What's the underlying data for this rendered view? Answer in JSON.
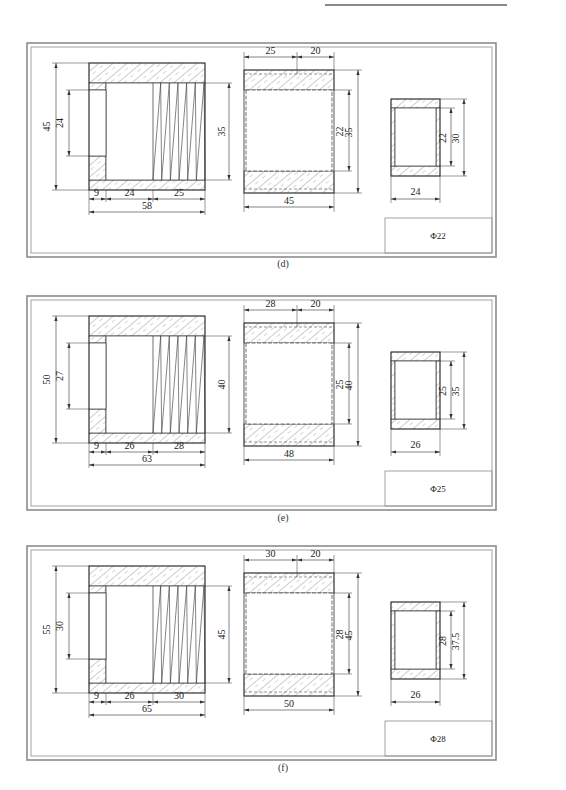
{
  "header": {
    "rule": "top-right running header rule"
  },
  "panels": [
    {
      "id": "d",
      "caption": "(d)",
      "title_block": "Φ22",
      "threaded_sleeve": {
        "outer_dia": "45",
        "bore_dia": "24",
        "thread_dia": "35",
        "len_a": "9",
        "len_b": "24",
        "len_c": "25",
        "total_len": "58"
      },
      "tube": {
        "len_left": "25",
        "len_right": "20",
        "inner_dia": "22",
        "outer_dia": "35",
        "total_len": "45"
      },
      "small_tube": {
        "inner_dia": "22",
        "outer_dia": "30",
        "length": "24"
      }
    },
    {
      "id": "e",
      "caption": "(e)",
      "title_block": "Φ25",
      "threaded_sleeve": {
        "outer_dia": "50",
        "bore_dia": "27",
        "thread_dia": "40",
        "len_a": "9",
        "len_b": "26",
        "len_c": "28",
        "total_len": "63"
      },
      "tube": {
        "len_left": "28",
        "len_right": "20",
        "inner_dia": "25",
        "outer_dia": "40",
        "total_len": "48"
      },
      "small_tube": {
        "inner_dia": "25",
        "outer_dia": "35",
        "length": "26"
      }
    },
    {
      "id": "f",
      "caption": "(f)",
      "title_block": "Φ28",
      "threaded_sleeve": {
        "outer_dia": "55",
        "bore_dia": "30",
        "thread_dia": "45",
        "len_a": "9",
        "len_b": "26",
        "len_c": "30",
        "total_len": "65"
      },
      "tube": {
        "len_left": "30",
        "len_right": "20",
        "inner_dia": "28",
        "outer_dia": "45",
        "total_len": "50"
      },
      "small_tube": {
        "inner_dia": "28",
        "outer_dia": "37.5",
        "length": "26"
      }
    }
  ],
  "colors": {
    "line": "#333333",
    "frame": "#8c8c8c",
    "hatch": "#555555"
  }
}
